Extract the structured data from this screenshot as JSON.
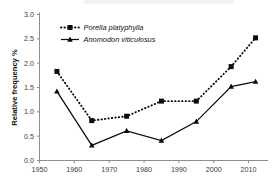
{
  "chart_data": {
    "type": "line",
    "title": "",
    "subtitle": "",
    "xlabel": "",
    "ylabel": "Relative frequency %",
    "xlim": [
      1950,
      2015
    ],
    "ylim": [
      0.0,
      3.0
    ],
    "grid": false,
    "legend_position": "top-left",
    "x_ticks": [
      1950,
      1960,
      1970,
      1980,
      1990,
      2000,
      2010
    ],
    "x_tick_labels": [
      "1950",
      "1960",
      "1970",
      "1980",
      "1990",
      "2000",
      "2010"
    ],
    "y_ticks": [
      0.0,
      0.5,
      1.0,
      1.5,
      2.0,
      2.5,
      3.0
    ],
    "y_tick_labels": [
      "0.0",
      "0.5",
      "1.0",
      "1.5",
      "2.0",
      "2.5",
      "3.0"
    ],
    "x": [
      1955,
      1965,
      1975,
      1985,
      1995,
      2005,
      2012
    ],
    "series": [
      {
        "name": "Porella platyphylla",
        "marker": "square",
        "line_style": "dotted",
        "color": "#0b0b0b",
        "values": [
          1.83,
          0.82,
          0.91,
          1.22,
          1.22,
          1.93,
          2.52
        ]
      },
      {
        "name": "Anomodon viticulosus",
        "marker": "triangle",
        "line_style": "solid",
        "color": "#0b0b0b",
        "values": [
          1.42,
          0.31,
          0.61,
          0.41,
          0.8,
          1.52,
          1.62
        ]
      }
    ]
  },
  "legend": {
    "items": [
      {
        "label": "Porella platyphylla"
      },
      {
        "label": "Anomodon viticulosus"
      }
    ]
  },
  "axes": {
    "y_title": "Relative frequency %"
  }
}
